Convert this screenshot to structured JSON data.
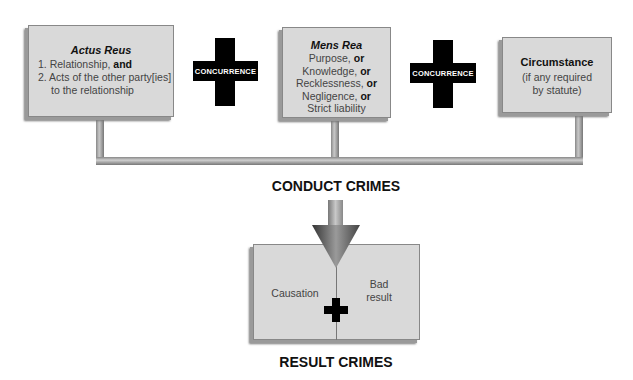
{
  "boxes": {
    "actus_reus": {
      "title": "Actus Reus",
      "items": [
        {
          "num": "1.",
          "text": "Relationship,",
          "conj": "and"
        },
        {
          "num": "2.",
          "text": "Acts of the other party[ies]",
          "cont": "to the relationship"
        }
      ]
    },
    "mens_rea": {
      "title": "Mens Rea",
      "lines": [
        {
          "text": "Purpose,",
          "conj": "or"
        },
        {
          "text": "Knowledge,",
          "conj": "or"
        },
        {
          "text": "Recklessness,",
          "conj": "or"
        },
        {
          "text": "Negligence,",
          "conj": "or"
        },
        {
          "text": "Strict liability",
          "conj": ""
        }
      ]
    },
    "circumstance": {
      "title": "Circumstance",
      "line1": "(if any required",
      "line2": "by statute)"
    }
  },
  "connectors": [
    {
      "label": "CONCURRENCE"
    },
    {
      "label": "CONCURRENCE"
    }
  ],
  "conduct_label": "CONDUCT CRIMES",
  "result_box": {
    "left": "Causation",
    "right_line1": "Bad",
    "right_line2": "result"
  },
  "result_label": "RESULT CRIMES",
  "colors": {
    "box_fill": "#d9d9d9",
    "cross": "#000000",
    "arrow": "#555555"
  }
}
